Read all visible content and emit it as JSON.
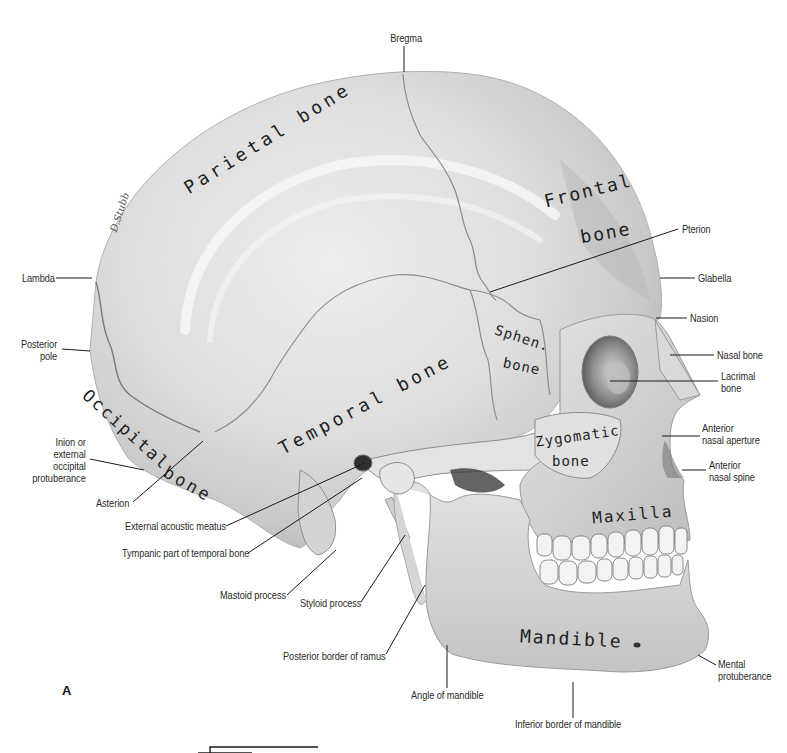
{
  "figure": {
    "panel_letter": "A",
    "signature": "D.Stubb",
    "view": "Lateral view of skull"
  },
  "bone_names": {
    "parietal": "Parietal bone",
    "frontal_1": "Frontal",
    "frontal_2": "bone",
    "temporal": "Temporal bone",
    "occipital_1": "Occipital",
    "occipital_2": "bone",
    "sphen_1": "Sphen.",
    "sphen_2": "bone",
    "zygomatic_1": "Zygomatic",
    "zygomatic_2": "bone",
    "maxilla": "Maxilla",
    "mandible": "Mandible"
  },
  "labels": {
    "bregma": "Bregma",
    "pterion": "Pterion",
    "glabella": "Glabella",
    "nasion": "Nasion",
    "nasal_bone": "Nasal bone",
    "lacrimal_1": "Lacrimal",
    "lacrimal_2": "bone",
    "ant_aperture_1": "Anterior",
    "ant_aperture_2": "nasal aperture",
    "ant_spine_1": "Anterior",
    "ant_spine_2": "nasal spine",
    "mental_1": "Mental",
    "mental_2": "protuberance",
    "inferior_border": "Inferior border of mandible",
    "angle": "Angle of mandible",
    "post_ramus": "Posterior border of ramus",
    "styloid": "Styloid process",
    "mastoid": "Mastoid process",
    "tympanic": "Tympanic part of temporal bone",
    "ext_meatus": "External acoustic meatus",
    "asterion": "Asterion",
    "inion_1": "Inion or",
    "inion_2": "external",
    "inion_3": "occipital",
    "inion_4": "protuberance",
    "posterior_pole_1": "Posterior",
    "posterior_pole_2": "pole",
    "lambda": "Lambda"
  },
  "colors": {
    "bone_light": "#e9e9e9",
    "bone_mid": "#cfcfcf",
    "bone_dark": "#9a9a9a",
    "shadow": "#4a4a4a",
    "line": "#1a1a1a"
  }
}
